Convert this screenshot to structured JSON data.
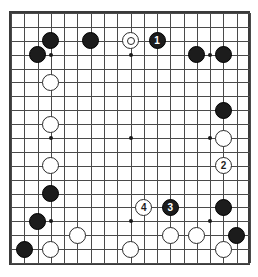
{
  "diagram": {
    "type": "go-board",
    "board_size": 19,
    "title": "",
    "geometry": {
      "origin_x": 9,
      "origin_y": 11,
      "cell": 13.28,
      "stone_diameter": 17,
      "board_pixel_width": 239,
      "board_pixel_height": 252
    },
    "colors": {
      "background": "#ffffff",
      "grid": "#4a4a4a",
      "border": "#3a3a3a",
      "black_stone": "#1c1c1c",
      "white_stone": "#ffffff",
      "white_stone_outline": "#2b2b2b",
      "black_label_text": "#ffffff",
      "white_label_text": "#1c1c1c"
    },
    "hoshi": [
      {
        "col": 3,
        "row": 3
      },
      {
        "col": 9,
        "row": 3
      },
      {
        "col": 15,
        "row": 3
      },
      {
        "col": 3,
        "row": 9
      },
      {
        "col": 9,
        "row": 9
      },
      {
        "col": 15,
        "row": 9
      },
      {
        "col": 3,
        "row": 15
      },
      {
        "col": 9,
        "row": 15
      },
      {
        "col": 15,
        "row": 15
      }
    ],
    "move_numbers": [
      {
        "label": "1",
        "color": "black",
        "col": 11,
        "row": 2
      },
      {
        "label": "2",
        "color": "white",
        "col": 16,
        "row": 11
      },
      {
        "label": "3",
        "color": "black",
        "col": 12,
        "row": 14
      },
      {
        "label": "4",
        "color": "white",
        "col": 10,
        "row": 14
      }
    ],
    "marked_stones": [
      {
        "marker": "circle",
        "color": "white",
        "col": 9,
        "row": 2
      }
    ],
    "stones": [
      {
        "color": "black",
        "col": 3,
        "row": 2,
        "label": "",
        "marker": ""
      },
      {
        "color": "black",
        "col": 6,
        "row": 2,
        "label": "",
        "marker": ""
      },
      {
        "color": "white",
        "col": 9,
        "row": 2,
        "label": "",
        "marker": "circle"
      },
      {
        "color": "black",
        "col": 11,
        "row": 2,
        "label": "1",
        "marker": ""
      },
      {
        "color": "black",
        "col": 2,
        "row": 3,
        "label": "",
        "marker": ""
      },
      {
        "color": "black",
        "col": 14,
        "row": 3,
        "label": "",
        "marker": ""
      },
      {
        "color": "black",
        "col": 16,
        "row": 3,
        "label": "",
        "marker": ""
      },
      {
        "color": "white",
        "col": 3,
        "row": 5,
        "label": "",
        "marker": ""
      },
      {
        "color": "black",
        "col": 16,
        "row": 7,
        "label": "",
        "marker": ""
      },
      {
        "color": "white",
        "col": 3,
        "row": 8,
        "label": "",
        "marker": ""
      },
      {
        "color": "white",
        "col": 16,
        "row": 9,
        "label": "",
        "marker": ""
      },
      {
        "color": "white",
        "col": 3,
        "row": 11,
        "label": "",
        "marker": ""
      },
      {
        "color": "white",
        "col": 16,
        "row": 11,
        "label": "2",
        "marker": ""
      },
      {
        "color": "black",
        "col": 3,
        "row": 13,
        "label": "",
        "marker": ""
      },
      {
        "color": "white",
        "col": 10,
        "row": 14,
        "label": "4",
        "marker": ""
      },
      {
        "color": "black",
        "col": 12,
        "row": 14,
        "label": "3",
        "marker": ""
      },
      {
        "color": "black",
        "col": 16,
        "row": 14,
        "label": "",
        "marker": ""
      },
      {
        "color": "black",
        "col": 2,
        "row": 15,
        "label": "",
        "marker": ""
      },
      {
        "color": "white",
        "col": 5,
        "row": 16,
        "label": "",
        "marker": ""
      },
      {
        "color": "white",
        "col": 12,
        "row": 16,
        "label": "",
        "marker": ""
      },
      {
        "color": "white",
        "col": 14,
        "row": 16,
        "label": "",
        "marker": ""
      },
      {
        "color": "black",
        "col": 17,
        "row": 16,
        "label": "",
        "marker": ""
      },
      {
        "color": "black",
        "col": 1,
        "row": 17,
        "label": "",
        "marker": ""
      },
      {
        "color": "white",
        "col": 3,
        "row": 17,
        "label": "",
        "marker": ""
      },
      {
        "color": "white",
        "col": 9,
        "row": 17,
        "label": "",
        "marker": ""
      },
      {
        "color": "white",
        "col": 16,
        "row": 17,
        "label": "",
        "marker": ""
      }
    ]
  }
}
